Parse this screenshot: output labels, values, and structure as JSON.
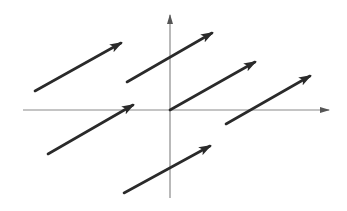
{
  "figure": {
    "colors": {
      "axis": "#8a8a8a",
      "vector": "#2a2a2a",
      "background": "#ffffff"
    },
    "axes": {
      "origin": [
        170,
        110
      ],
      "x_axis": {
        "from": [
          23,
          110
        ],
        "to": [
          329,
          110
        ]
      },
      "y_axis": {
        "from": [
          170,
          198
        ],
        "to": [
          170,
          15
        ]
      }
    },
    "vectors": [
      {
        "id": "v1",
        "tail": [
          35,
          91
        ],
        "head": [
          121,
          43
        ]
      },
      {
        "id": "v2",
        "tail": [
          127,
          82
        ],
        "head": [
          212,
          33
        ]
      },
      {
        "id": "v3",
        "tail": [
          170,
          110
        ],
        "head": [
          255,
          62
        ]
      },
      {
        "id": "v4",
        "tail": [
          226,
          124
        ],
        "head": [
          310,
          76
        ]
      },
      {
        "id": "v5",
        "tail": [
          48,
          154
        ],
        "head": [
          133,
          105
        ]
      },
      {
        "id": "v6",
        "tail": [
          124,
          193
        ],
        "head": [
          210,
          146
        ]
      }
    ]
  }
}
